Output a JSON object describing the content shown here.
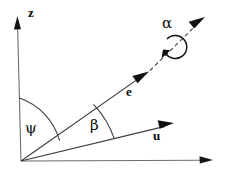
{
  "figure": {
    "kind": "vector-angle-diagram",
    "width": 225,
    "height": 172,
    "background_color": "#ffffff",
    "line_color": "#3a3a3a",
    "axis_color": "#6e6e6e",
    "label_color": "#0d0d0d"
  },
  "axes": {
    "vertical": {
      "name": "z-axis",
      "label": "z",
      "origin": [
        21,
        161
      ],
      "tip": [
        17,
        17
      ]
    },
    "horizontal": {
      "name": "horizontal-axis",
      "label": "",
      "origin": [
        21,
        161
      ],
      "tip": [
        212,
        160
      ]
    }
  },
  "vectors": [
    {
      "name": "e-vector",
      "label": "e",
      "origin": [
        21,
        161
      ],
      "tip": [
        147,
        73
      ],
      "style": "solid-with-dashed-extension",
      "dashed_extension_tip": [
        204,
        19
      ]
    },
    {
      "name": "u-vector",
      "label": "u",
      "origin": [
        21,
        161
      ],
      "tip": [
        172,
        124
      ],
      "style": "solid"
    }
  ],
  "angles": [
    {
      "name": "psi-angle",
      "label": "ψ",
      "between": [
        "z-axis",
        "e-vector"
      ],
      "arc_radius": 63
    },
    {
      "name": "beta-angle",
      "label": "β",
      "between": [
        "e-vector",
        "u-vector"
      ],
      "arc_radius": 95
    },
    {
      "name": "alpha-angle",
      "label": "α",
      "about": "e-vector",
      "type": "rotation-about-axis",
      "center": [
        175,
        47
      ],
      "radius": 11
    }
  ]
}
